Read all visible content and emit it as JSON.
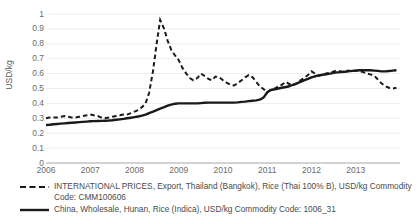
{
  "chart_data": {
    "type": "line",
    "title": "",
    "xlabel": "",
    "ylabel": "USD/kg",
    "ylim": [
      0,
      1
    ],
    "xlim": [
      2006,
      2014
    ],
    "grid": true,
    "legend_position": "bottom",
    "y_ticks": [
      "0",
      "0.1",
      "0.2",
      "0.3",
      "0.4",
      "0.5",
      "0.6",
      "0.7",
      "0.8",
      "0.9",
      "1"
    ],
    "x_ticks": [
      "2006",
      "2007",
      "2008",
      "2009",
      "2010",
      "2011",
      "2012",
      "2013"
    ],
    "series": [
      {
        "name": "INTERNATIONAL PRICES, Export, Thailand (Bangkok), Rice (Thai 100% B), USD/kg Commodity Code: CMM100606",
        "style": "dashed",
        "color": "#1a1a1a",
        "x": [
          2006.0,
          2006.08,
          2006.17,
          2006.25,
          2006.33,
          2006.42,
          2006.5,
          2006.58,
          2006.67,
          2006.75,
          2006.83,
          2006.92,
          2007.0,
          2007.08,
          2007.17,
          2007.25,
          2007.33,
          2007.42,
          2007.5,
          2007.58,
          2007.67,
          2007.75,
          2007.83,
          2007.92,
          2008.0,
          2008.08,
          2008.17,
          2008.25,
          2008.33,
          2008.42,
          2008.5,
          2008.58,
          2008.67,
          2008.75,
          2008.83,
          2008.92,
          2009.0,
          2009.08,
          2009.17,
          2009.25,
          2009.33,
          2009.42,
          2009.5,
          2009.58,
          2009.67,
          2009.75,
          2009.83,
          2009.92,
          2010.0,
          2010.08,
          2010.17,
          2010.25,
          2010.33,
          2010.42,
          2010.5,
          2010.58,
          2010.67,
          2010.75,
          2010.83,
          2010.92,
          2011.0,
          2011.08,
          2011.17,
          2011.25,
          2011.33,
          2011.42,
          2011.5,
          2011.58,
          2011.67,
          2011.75,
          2011.83,
          2011.92,
          2012.0,
          2012.08,
          2012.17,
          2012.25,
          2012.33,
          2012.42,
          2012.5,
          2012.58,
          2012.67,
          2012.75,
          2012.83,
          2012.92,
          2013.0,
          2013.08,
          2013.17,
          2013.25,
          2013.33,
          2013.42,
          2013.5,
          2013.58,
          2013.67,
          2013.75,
          2013.83,
          2013.92
        ],
        "values": [
          0.3,
          0.305,
          0.305,
          0.305,
          0.31,
          0.315,
          0.31,
          0.305,
          0.305,
          0.31,
          0.315,
          0.32,
          0.325,
          0.32,
          0.315,
          0.305,
          0.3,
          0.305,
          0.31,
          0.315,
          0.32,
          0.325,
          0.325,
          0.335,
          0.345,
          0.355,
          0.375,
          0.4,
          0.47,
          0.62,
          0.8,
          0.96,
          0.9,
          0.82,
          0.76,
          0.72,
          0.69,
          0.64,
          0.6,
          0.57,
          0.555,
          0.57,
          0.6,
          0.585,
          0.565,
          0.555,
          0.58,
          0.575,
          0.555,
          0.54,
          0.525,
          0.52,
          0.535,
          0.555,
          0.575,
          0.59,
          0.575,
          0.545,
          0.515,
          0.495,
          0.475,
          0.49,
          0.5,
          0.515,
          0.525,
          0.545,
          0.53,
          0.52,
          0.535,
          0.555,
          0.57,
          0.59,
          0.615,
          0.6,
          0.585,
          0.595,
          0.6,
          0.605,
          0.615,
          0.62,
          0.615,
          0.61,
          0.62,
          0.615,
          0.62,
          0.615,
          0.61,
          0.6,
          0.595,
          0.585,
          0.56,
          0.535,
          0.515,
          0.505,
          0.5,
          0.505
        ]
      },
      {
        "name": "China, Wholesale, Hunan, Rice (Indica), USD/kg Commodity Code: 1006_31",
        "style": "solid",
        "color": "#1a1a1a",
        "x": [
          2006.0,
          2006.08,
          2006.17,
          2006.25,
          2006.33,
          2006.42,
          2006.5,
          2006.58,
          2006.67,
          2006.75,
          2006.83,
          2006.92,
          2007.0,
          2007.08,
          2007.17,
          2007.25,
          2007.33,
          2007.42,
          2007.5,
          2007.58,
          2007.67,
          2007.75,
          2007.83,
          2007.92,
          2008.0,
          2008.08,
          2008.17,
          2008.25,
          2008.33,
          2008.42,
          2008.5,
          2008.58,
          2008.67,
          2008.75,
          2008.83,
          2008.92,
          2009.0,
          2009.08,
          2009.17,
          2009.25,
          2009.33,
          2009.42,
          2009.5,
          2009.58,
          2009.67,
          2009.75,
          2009.83,
          2009.92,
          2010.0,
          2010.08,
          2010.17,
          2010.25,
          2010.33,
          2010.42,
          2010.5,
          2010.58,
          2010.67,
          2010.75,
          2010.83,
          2010.92,
          2011.0,
          2011.08,
          2011.17,
          2011.25,
          2011.33,
          2011.42,
          2011.5,
          2011.58,
          2011.67,
          2011.75,
          2011.83,
          2011.92,
          2012.0,
          2012.08,
          2012.17,
          2012.25,
          2012.33,
          2012.42,
          2012.5,
          2012.58,
          2012.67,
          2012.75,
          2012.83,
          2012.92,
          2013.0,
          2013.08,
          2013.17,
          2013.25,
          2013.33,
          2013.42,
          2013.5,
          2013.58,
          2013.67,
          2013.75,
          2013.83,
          2013.92
        ],
        "values": [
          0.255,
          0.257,
          0.26,
          0.262,
          0.264,
          0.266,
          0.268,
          0.27,
          0.272,
          0.274,
          0.276,
          0.278,
          0.28,
          0.281,
          0.282,
          0.283,
          0.284,
          0.285,
          0.287,
          0.29,
          0.293,
          0.296,
          0.3,
          0.304,
          0.308,
          0.312,
          0.318,
          0.325,
          0.335,
          0.345,
          0.355,
          0.365,
          0.375,
          0.385,
          0.392,
          0.398,
          0.4,
          0.4,
          0.4,
          0.4,
          0.4,
          0.4,
          0.402,
          0.404,
          0.405,
          0.405,
          0.405,
          0.405,
          0.405,
          0.405,
          0.405,
          0.405,
          0.407,
          0.41,
          0.412,
          0.415,
          0.418,
          0.42,
          0.425,
          0.44,
          0.475,
          0.49,
          0.495,
          0.5,
          0.505,
          0.51,
          0.515,
          0.525,
          0.535,
          0.545,
          0.555,
          0.565,
          0.575,
          0.582,
          0.588,
          0.592,
          0.596,
          0.6,
          0.605,
          0.608,
          0.61,
          0.612,
          0.615,
          0.618,
          0.62,
          0.622,
          0.622,
          0.622,
          0.622,
          0.62,
          0.618,
          0.615,
          0.615,
          0.617,
          0.62,
          0.622
        ]
      }
    ]
  },
  "axis": {
    "y_title": "USD/kg"
  },
  "legend": {
    "items": [
      {
        "marker": "dashed-line-key",
        "line1": "INTERNATIONAL PRICES, Export, Thailand (Bangkok), Rice (Thai 100% B), USD/kg Commodity",
        "line2": "Code: CMM100606"
      },
      {
        "marker": "solid-line-key",
        "line1": "China, Wholesale, Hunan, Rice (Indica), USD/kg Commodity Code: 1006_31",
        "line2": ""
      }
    ]
  }
}
